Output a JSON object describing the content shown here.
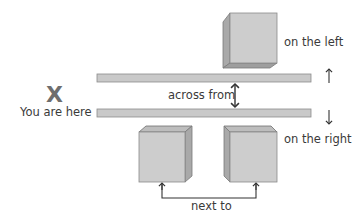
{
  "diagram": {
    "colors": {
      "cube_front": "#cdcdcd",
      "cube_side": "#a9a9a9",
      "cube_top": "#bdbdbd",
      "cube_stroke": "#7a7a7a",
      "bar_fill": "#c9c9c9",
      "bar_stroke": "#8c8c8c",
      "arrow": "#333333",
      "x_mark": "#6e6e6e",
      "text": "#3a3a3a"
    },
    "marker": {
      "symbol": "X",
      "label": "You are here"
    },
    "labels": {
      "on_the_left": "on the left",
      "on_the_right": "on the right",
      "across_from": "across from",
      "next_to": "next to"
    },
    "direction_arrows": {
      "up": "↑",
      "down": "↓"
    },
    "street_bars": [
      {
        "name": "upper-street-edge",
        "x": 97,
        "y": 74,
        "width": 214,
        "height": 8
      },
      {
        "name": "lower-street-edge",
        "x": 97,
        "y": 109,
        "width": 214,
        "height": 8
      }
    ],
    "buildings": [
      {
        "name": "building-top",
        "position": "on the left"
      },
      {
        "name": "building-bottom-left",
        "position": "on the right"
      },
      {
        "name": "building-bottom-right",
        "position": "on the right"
      }
    ]
  }
}
